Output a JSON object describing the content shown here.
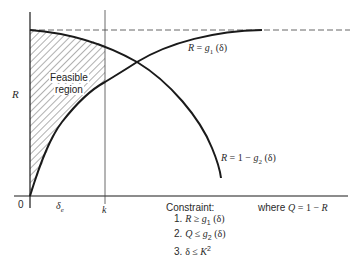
{
  "diagram": {
    "y_axis_label": "R",
    "origin_label": "0",
    "x_ticks": {
      "delta_e": "δ",
      "delta_e_sub": "e",
      "k": "k"
    },
    "region_label_line1": "Feasible",
    "region_label_line2": "region",
    "curves": {
      "upper_label_lhs": "R",
      "upper_label_eq": " = ",
      "upper_label_fn": "g",
      "upper_label_sub": "1",
      "upper_label_arg": " (δ)",
      "lower_label_lhs": "R",
      "lower_label_eq": " = 1 − ",
      "lower_label_fn": "g",
      "lower_label_sub": "2",
      "lower_label_arg": " (δ)"
    },
    "constraint_heading": "Constraint:",
    "constraints": [
      {
        "num": "1. ",
        "lhs": "R",
        "op": " ≥ ",
        "fn": "g",
        "sub": "1",
        "arg": " (δ)"
      },
      {
        "num": "2. ",
        "lhs": "Q",
        "op": " ≤ ",
        "fn": "g",
        "sub": "2",
        "arg": " (δ)"
      },
      {
        "num": "3. ",
        "lhs": "δ",
        "op": " ≤ ",
        "fn": "K",
        "sup": "2"
      }
    ],
    "where_prefix": "where ",
    "where_lhs": "Q",
    "where_rhs": " = 1 − ",
    "where_var": "R",
    "colors": {
      "line": "#1a1a1a",
      "hatch": "#3a3a3a",
      "background": "#ffffff"
    }
  }
}
